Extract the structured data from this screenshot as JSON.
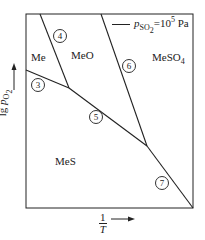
{
  "diagram": {
    "type": "predominance-area-diagram",
    "regions": {
      "me": "Me",
      "meo": "MeO",
      "meso4": "MeSO",
      "meso4_sub": "4",
      "mes": "MeS"
    },
    "boundaries": [
      {
        "id": "3",
        "label": "3",
        "between": [
          "Me",
          "MeS"
        ]
      },
      {
        "id": "4",
        "label": "4",
        "between": [
          "Me",
          "MeO"
        ]
      },
      {
        "id": "5",
        "label": "5",
        "between": [
          "MeO",
          "MeS"
        ]
      },
      {
        "id": "6",
        "label": "6",
        "between": [
          "MeO",
          "MeSO4"
        ]
      },
      {
        "id": "7",
        "label": "7",
        "between": [
          "MeS",
          "MeSO4"
        ]
      }
    ],
    "legend": {
      "symbol": "p",
      "sub": "SO",
      "subsub": "2",
      "eq": "=10",
      "exp": "5",
      "unit": " Pa"
    },
    "yaxis": {
      "prefix": "lg ",
      "symbol": "p",
      "sub": "O",
      "subsub": "2",
      "arrow": "up-arrow"
    },
    "xaxis": {
      "num": "1",
      "den": "T",
      "arrow": "right-arrow"
    },
    "colors": {
      "line": "#222222",
      "background": "#ffffff"
    }
  }
}
